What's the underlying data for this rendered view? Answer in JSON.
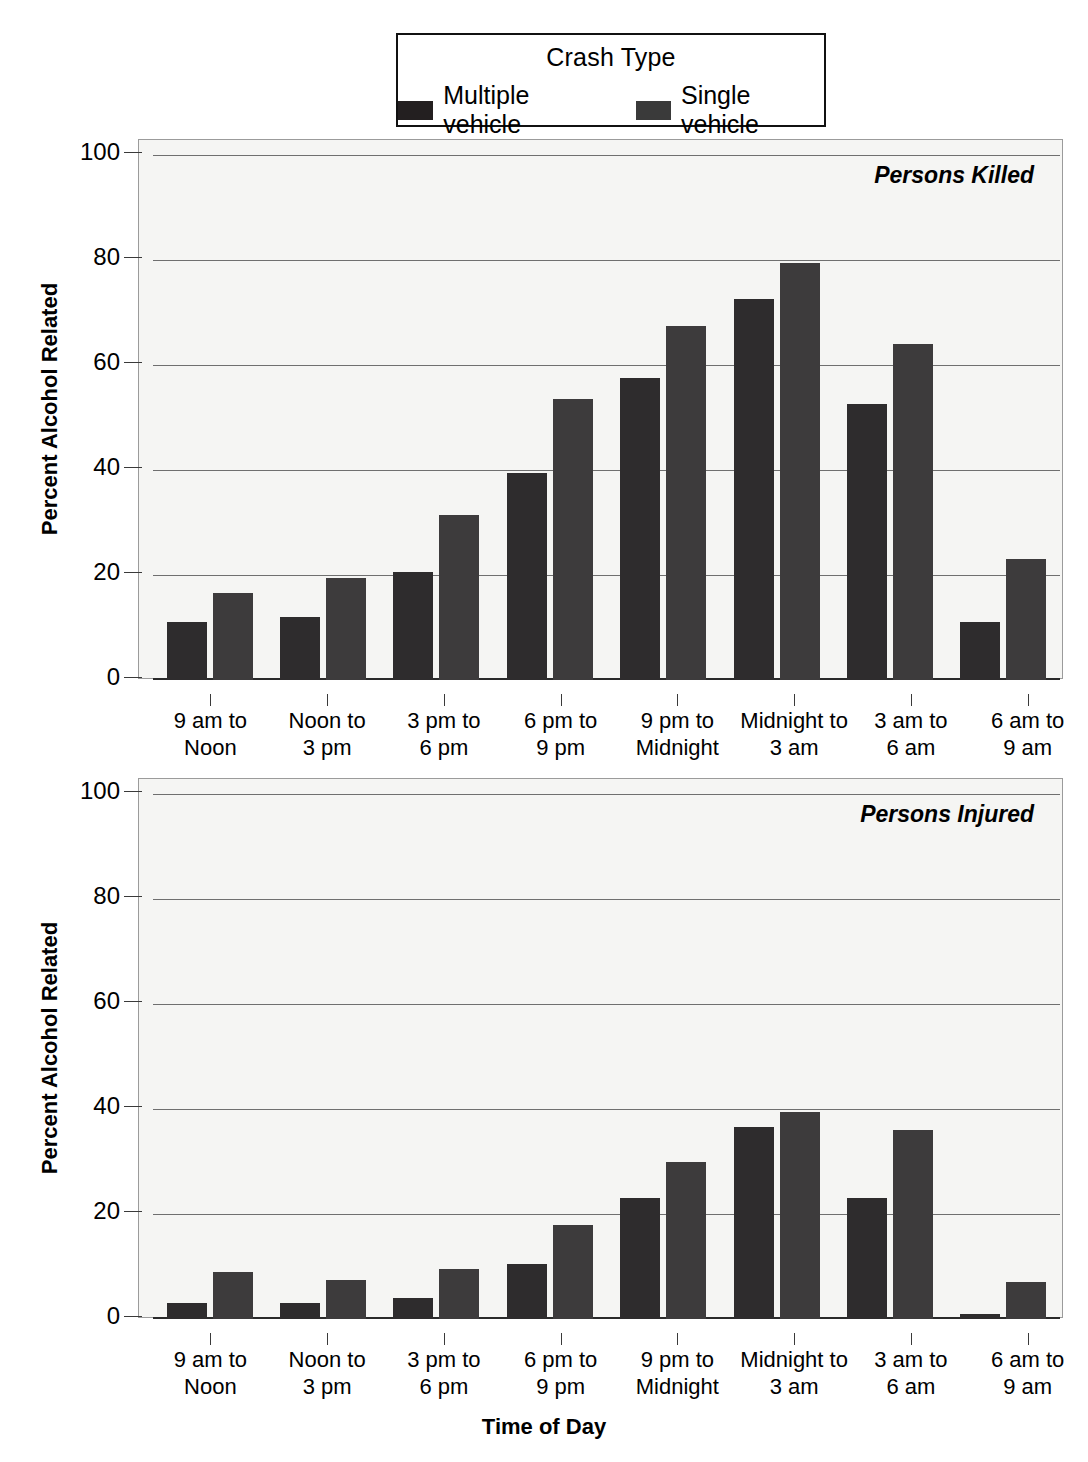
{
  "legend": {
    "title": "Crash Type",
    "entries": [
      {
        "label": "Multiple vehicle",
        "color": "#2e2c2d",
        "key": "multiple"
      },
      {
        "label": "Single vehicle",
        "color": "#3d3b3c",
        "key": "single"
      }
    ]
  },
  "axis": {
    "y_title": "Percent Alcohol Related",
    "x_title": "Time of Day",
    "y_ticks": [
      "0",
      "20",
      "40",
      "60",
      "80",
      "100"
    ]
  },
  "panels": [
    {
      "tag": "Persons Killed"
    },
    {
      "tag": "Persons Injured"
    }
  ],
  "chart_data": [
    {
      "type": "bar",
      "title": "Persons Killed",
      "xlabel": "Time of Day",
      "ylabel": "Percent Alcohol Related",
      "ylim": [
        0,
        100
      ],
      "yticks": [
        0,
        20,
        40,
        60,
        80,
        100
      ],
      "grid": true,
      "legend_position": "top-center",
      "legend_title": "Crash Type",
      "categories": [
        "9 am to Noon",
        "Noon to 3 pm",
        "3 pm to 6 pm",
        "6 pm to 9 pm",
        "9 pm to Midnight",
        "Midnight to 3 am",
        "3 am to 6 am",
        "6 am to 9 am"
      ],
      "series": [
        {
          "name": "Multiple vehicle",
          "values": [
            11,
            12,
            20.5,
            39.5,
            57.5,
            72.5,
            52.5,
            11
          ]
        },
        {
          "name": "Single vehicle",
          "values": [
            16.5,
            19.5,
            31.5,
            53.5,
            67.5,
            79.5,
            64,
            23
          ]
        }
      ]
    },
    {
      "type": "bar",
      "title": "Persons Injured",
      "xlabel": "Time of Day",
      "ylabel": "Percent Alcohol Related",
      "ylim": [
        0,
        100
      ],
      "yticks": [
        0,
        20,
        40,
        60,
        80,
        100
      ],
      "grid": true,
      "legend_position": "top-center",
      "legend_title": "Crash Type",
      "categories": [
        "9 am to Noon",
        "Noon to 3 pm",
        "3 pm to 6 pm",
        "6 pm to 9 pm",
        "9 pm to Midnight",
        "Midnight to 3 am",
        "3 am to 6 am",
        "6 am to 9 am"
      ],
      "series": [
        {
          "name": "Multiple vehicle",
          "values": [
            3,
            3,
            4,
            10.5,
            23,
            36.5,
            23,
            1
          ]
        },
        {
          "name": "Single vehicle",
          "values": [
            9,
            7.5,
            9.5,
            18,
            30,
            39.5,
            36,
            7
          ]
        }
      ]
    }
  ],
  "xaxis_labels_line1": [
    "9 am to",
    "Noon to",
    "3 pm to",
    "6 pm to",
    "9 pm to",
    "Midnight to",
    "3 am to",
    "6 am to"
  ],
  "xaxis_labels_line2": [
    "Noon",
    "3 pm",
    "6 pm",
    "9 pm",
    "Midnight",
    "3 am",
    "6 am",
    "9 am"
  ]
}
